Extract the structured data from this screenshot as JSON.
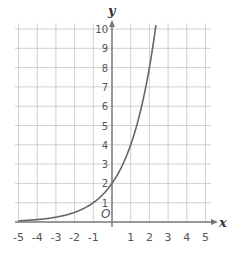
{
  "chart_data": {
    "type": "line",
    "title": "",
    "xlabel": "x",
    "ylabel": "y",
    "origin_label": "O",
    "xlim": [
      -5,
      5
    ],
    "ylim": [
      0,
      10
    ],
    "grid": true,
    "x_ticks": [
      "-5",
      "-4",
      "-3",
      "-2",
      "-1",
      "1",
      "2",
      "3",
      "4",
      "5"
    ],
    "y_ticks": [
      "1",
      "2",
      "3",
      "4",
      "5",
      "6",
      "7",
      "8",
      "9",
      "10"
    ],
    "series": [
      {
        "name": "y = 2·2^x",
        "x": [
          -5,
          -4,
          -3,
          -2,
          -1,
          0,
          1,
          2,
          2.32
        ],
        "y": [
          0.0625,
          0.125,
          0.25,
          0.5,
          1,
          2,
          4,
          8,
          10
        ],
        "color": "#666666"
      }
    ]
  },
  "colors": {
    "grid": "#d0d0d0",
    "axis": "#777777",
    "curve": "#666666"
  }
}
